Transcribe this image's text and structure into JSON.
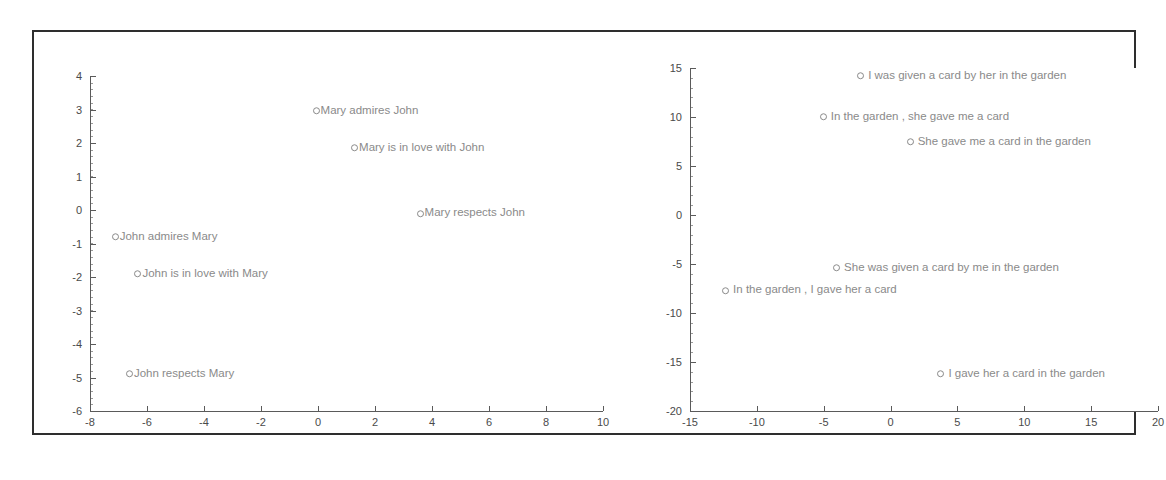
{
  "figure": {
    "background_color": "#ffffff",
    "frame_color": "#2e2e2e",
    "marker_color": "#8a8a8a",
    "axis_color": "#5a5a5a",
    "label_color": "#8a8a8a"
  },
  "chart_data": [
    {
      "type": "scatter",
      "name": "left-plot",
      "title": "",
      "xlabel": "",
      "ylabel": "",
      "xlim": [
        -8,
        10
      ],
      "ylim": [
        -6,
        4
      ],
      "xticks": [
        -8,
        -6,
        -4,
        -2,
        0,
        2,
        4,
        6,
        8,
        10
      ],
      "yticks": [
        -6,
        -5,
        -4,
        -3,
        -2,
        -1,
        0,
        1,
        2,
        3,
        4
      ],
      "xticklabels": [
        "-8",
        "-6",
        "-4",
        "-2",
        "0",
        "2",
        "4",
        "6",
        "8",
        "10"
      ],
      "yticklabels": [
        "-6",
        "-5",
        "-4",
        "-3",
        "-2",
        "-1",
        "0",
        "1",
        "2",
        "3",
        "4"
      ],
      "grid": false,
      "legend": "none",
      "points": [
        {
          "label": "Mary admires John",
          "x": -0.05,
          "y": 2.95
        },
        {
          "label": "Mary is in love with John",
          "x": 1.3,
          "y": 1.85
        },
        {
          "label": "Mary respects John",
          "x": 3.6,
          "y": -0.1
        },
        {
          "label": "John admires Mary",
          "x": -7.1,
          "y": -0.8
        },
        {
          "label": "John is in love with Mary",
          "x": -6.3,
          "y": -1.9
        },
        {
          "label": "John respects Mary",
          "x": -6.6,
          "y": -4.9
        }
      ]
    },
    {
      "type": "scatter",
      "name": "right-plot",
      "title": "",
      "xlabel": "",
      "ylabel": "",
      "xlim": [
        -15,
        20
      ],
      "ylim": [
        -20,
        15
      ],
      "xticks": [
        -15,
        -10,
        -5,
        0,
        5,
        10,
        15,
        20
      ],
      "yticks": [
        -20,
        -15,
        -10,
        -5,
        0,
        5,
        10,
        15
      ],
      "xticklabels": [
        "-15",
        "-10",
        "-5",
        "0",
        "5",
        "10",
        "15",
        "20"
      ],
      "yticklabels": [
        "-20",
        "-15",
        "-10",
        "-5",
        "0",
        "5",
        "10",
        "15"
      ],
      "grid": false,
      "legend": "none",
      "points": [
        {
          "label": "I was given a card by her in the garden",
          "x": -2.2,
          "y": 14.2
        },
        {
          "label": "In the garden , she gave me a card",
          "x": -5.0,
          "y": 10.0
        },
        {
          "label": "She gave me a card in the garden",
          "x": 1.5,
          "y": 7.5
        },
        {
          "label": "She was given a card by me in the garden",
          "x": -4.0,
          "y": -5.4
        },
        {
          "label": "In the garden , I gave her a card",
          "x": -12.3,
          "y": -7.7
        },
        {
          "label": "I gave her a card in the garden",
          "x": 3.8,
          "y": -16.2
        }
      ]
    }
  ]
}
